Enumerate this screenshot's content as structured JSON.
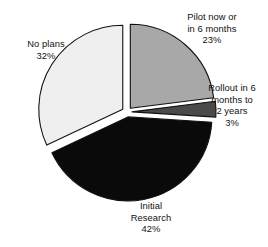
{
  "chart_data": {
    "type": "pie",
    "title": "",
    "subtitle": "",
    "xlabel": "",
    "ylabel": "",
    "legend_position": "none",
    "grid": false,
    "labels_on_slices": false,
    "label_placement": "outside",
    "start_angle_deg": 0,
    "direction": "clockwise",
    "categories": [
      "Pilot now or in 6 months",
      "Rollout in 6 months to 2 years",
      "Initial Research",
      "No plans"
    ],
    "values": [
      23,
      3,
      42,
      32
    ],
    "value_unit": "percent",
    "slices": [
      {
        "name": "pilot",
        "label_lines": [
          "Pilot now or",
          "in 6 months"
        ],
        "percent_text": "23%",
        "value": 23,
        "color": "#a8a8a8",
        "exploded": true
      },
      {
        "name": "rollout",
        "label_lines": [
          "Rollout in 6",
          "months to",
          "2 years"
        ],
        "percent_text": "3%",
        "value": 3,
        "color": "#4a4a4a",
        "exploded": true
      },
      {
        "name": "initial-research",
        "label_lines": [
          "Initial",
          "Research"
        ],
        "percent_text": "42%",
        "value": 42,
        "color": "#0a0a0a",
        "exploded": true
      },
      {
        "name": "no-plans",
        "label_lines": [
          "No plans"
        ],
        "percent_text": "32%",
        "value": 32,
        "color": "#efefef",
        "exploded": true
      }
    ]
  },
  "labels": {
    "pilot": {
      "line1": "Pilot now or",
      "line2": "in 6 months",
      "pct": "23%"
    },
    "rollout": {
      "line1": "Rollout in 6",
      "line2": "months to",
      "line3": "2 years",
      "pct": "3%"
    },
    "noplans": {
      "line1": "No plans",
      "pct": "32%"
    },
    "initial": {
      "line1": "Initial",
      "line2": "Research",
      "pct": "42%"
    }
  },
  "colors": {
    "pilot": "#a8a8a8",
    "rollout": "#4a4a4a",
    "initial": "#0a0a0a",
    "noplans": "#efefef",
    "outline": "#111111",
    "background": "#ffffff",
    "text": "#111111"
  },
  "geometry": {
    "cx": 127,
    "cy": 112,
    "r": 84,
    "explode": 5
  }
}
